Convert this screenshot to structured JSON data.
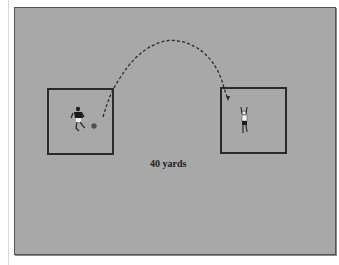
{
  "diagram": {
    "distance_label": "40 yards",
    "colors": {
      "field": "#a8a8a8",
      "box_border": "#2a2a2a",
      "trajectory": "#2a2a2a"
    },
    "elements": [
      {
        "type": "grid-box",
        "name": "kicker-box",
        "x": 47,
        "y": 88,
        "w": 66,
        "h": 66
      },
      {
        "type": "grid-box",
        "name": "receiver-box",
        "x": 220,
        "y": 87,
        "w": 66,
        "h": 66
      },
      {
        "type": "player",
        "name": "kicker-player",
        "role": "kicking"
      },
      {
        "type": "ball",
        "name": "soccer-ball"
      },
      {
        "type": "player",
        "name": "receiver-player",
        "role": "receiving, arms raised"
      },
      {
        "type": "trajectory",
        "name": "lofted-pass-arc",
        "style": "dashed with arrowhead"
      }
    ]
  }
}
